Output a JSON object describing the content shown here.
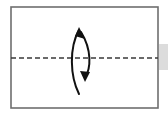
{
  "canvas": {
    "width": 168,
    "height": 119,
    "background_color": "#ffffff"
  },
  "figure": {
    "name": "fold-rotation-diagram"
  },
  "frame": {
    "name": "panel-border",
    "x": 11,
    "y": 7,
    "width": 147,
    "height": 101,
    "stroke_color": "#6e6e6e",
    "stroke_width": 1.6,
    "fill_color": "#ffffff"
  },
  "fold_line": {
    "name": "dashed-center-line",
    "label": "fold axis",
    "x1": 11,
    "x2": 158,
    "y": 58,
    "stroke_color": "#3a3a3a",
    "stroke_width": 1.4,
    "dash_pattern": "5 3"
  },
  "arrow": {
    "name": "curved-fold-arrow",
    "stroke_color": "#111111",
    "outer_path": "M 79 94 C 70 76 69 48 79 30",
    "outer_stroke_width": 2.0,
    "inner_path": "M 81 32 C 92 50 91 68 85 78",
    "inner_stroke_width": 2.0,
    "head_top": {
      "name": "arrowhead-up",
      "points": "79,27 85,39 75,36",
      "direction": "up-left"
    },
    "head_bottom": {
      "name": "arrowhead-down",
      "points": "85,82 80,71 90,72",
      "direction": "down"
    }
  },
  "edge_strip": {
    "name": "right-edge-highlight",
    "x": 159,
    "y": 44,
    "width": 9,
    "height": 26,
    "fill_color": "#dcdcdc"
  }
}
